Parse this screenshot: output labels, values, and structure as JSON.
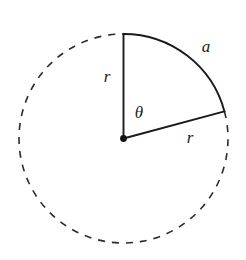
{
  "figure": {
    "type": "geometry-diagram",
    "background_color": "#ffffff",
    "stroke_color": "#1a1a1a",
    "canvas": {
      "width": 246,
      "height": 260
    }
  },
  "circle": {
    "center": {
      "x": 123.5,
      "y": 138.5
    },
    "radius": 104.5,
    "dashed_stroke_width": 1.6,
    "solid_stroke_width": 1.8,
    "dash_pattern": "7 7"
  },
  "sector": {
    "start_angle_deg": 90,
    "end_angle_deg": 15,
    "sweep_deg": 75,
    "arc_is_solid": true,
    "remainder_is_dashed": true
  },
  "radii": [
    {
      "name": "vertical-radius",
      "from": {
        "x": 123.5,
        "y": 138.5
      },
      "to": {
        "x": 123.5,
        "y": 34.0
      },
      "angle_deg": 90,
      "label": "r"
    },
    {
      "name": "angled-radius",
      "from": {
        "x": 123.5,
        "y": 138.5
      },
      "to": {
        "x": 224.4,
        "y": 111.5
      },
      "angle_deg": 15,
      "label": "r"
    }
  ],
  "center_dot": {
    "x": 123.5,
    "y": 138.5,
    "radius": 3.4,
    "filled": true
  },
  "labels": {
    "radius_vertical": {
      "text": "r",
      "x": 107,
      "y": 78,
      "font_size": 17
    },
    "theta": {
      "text": "θ",
      "x": 139,
      "y": 114,
      "font_size": 18
    },
    "arc_length": {
      "text": "a",
      "x": 206,
      "y": 48,
      "font_size": 17
    },
    "radius_angled": {
      "text": "r",
      "x": 190,
      "y": 139,
      "font_size": 17
    }
  },
  "legend_meaning": {
    "r": "radius of the circle",
    "a": "arc length subtended by the central angle",
    "theta": "central angle"
  }
}
